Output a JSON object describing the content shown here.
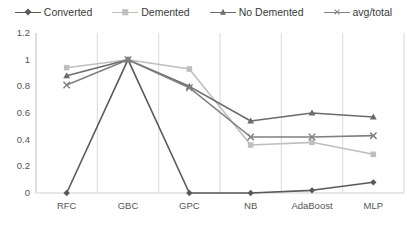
{
  "chart_data": {
    "type": "line",
    "title": "",
    "xlabel": "",
    "ylabel": "",
    "categories": [
      "RFC",
      "GBC",
      "GPC",
      "NB",
      "AdaBoost",
      "MLP"
    ],
    "ylim": [
      0,
      1.2
    ],
    "yticks": [
      "0",
      "0.2",
      "0.4",
      "0.6",
      "0.8",
      "1",
      "1.2"
    ],
    "ytick_values": [
      0,
      0.2,
      0.4,
      0.6,
      0.8,
      1.0,
      1.2
    ],
    "grid": "vertical",
    "legend_position": "top",
    "series": [
      {
        "name": "Converted",
        "marker": "diamond",
        "color": "#595959",
        "values": [
          0,
          1.0,
          0,
          0,
          0.02,
          0.08
        ]
      },
      {
        "name": "Demented",
        "marker": "square",
        "color": "#bfbfbf",
        "values": [
          0.94,
          1.0,
          0.93,
          0.36,
          0.38,
          0.29
        ]
      },
      {
        "name": "No Demented",
        "marker": "triangle",
        "color": "#6b6b6b",
        "values": [
          0.88,
          1.0,
          0.8,
          0.54,
          0.6,
          0.57
        ]
      },
      {
        "name": "avg/total",
        "marker": "x",
        "color": "#808080",
        "values": [
          0.81,
          1.0,
          0.79,
          0.42,
          0.42,
          0.43
        ]
      }
    ]
  },
  "colors": {
    "axis": "#d0d0d0",
    "gridline": "#d9d9d9",
    "text": "#555555",
    "background": "#ffffff"
  }
}
